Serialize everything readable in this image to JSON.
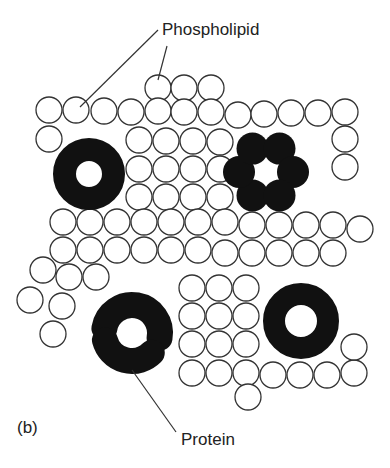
{
  "figure": {
    "panel_label": "(b)",
    "labels": {
      "phospholipid": "Phospholipid",
      "protein": "Protein"
    },
    "colors": {
      "stroke": "#333333",
      "protein_fill": "#111111",
      "background": "#ffffff"
    },
    "phospholipid_radius": 13,
    "phospholipids": [
      [
        158,
        88
      ],
      [
        184,
        88
      ],
      [
        211,
        88
      ],
      [
        49,
        110
      ],
      [
        76,
        110
      ],
      [
        104,
        111
      ],
      [
        131,
        112
      ],
      [
        158,
        111
      ],
      [
        184,
        112
      ],
      [
        211,
        112
      ],
      [
        238,
        115
      ],
      [
        264,
        114
      ],
      [
        291,
        113
      ],
      [
        318,
        113
      ],
      [
        345,
        112
      ],
      [
        49,
        139
      ],
      [
        139,
        140
      ],
      [
        166,
        141
      ],
      [
        193,
        141
      ],
      [
        220,
        142
      ],
      [
        345,
        139
      ],
      [
        139,
        169
      ],
      [
        166,
        169
      ],
      [
        193,
        169
      ],
      [
        220,
        169
      ],
      [
        345,
        167
      ],
      [
        139,
        197
      ],
      [
        166,
        197
      ],
      [
        193,
        197
      ],
      [
        220,
        197
      ],
      [
        63,
        222
      ],
      [
        90,
        222
      ],
      [
        117,
        222
      ],
      [
        144,
        222
      ],
      [
        171,
        222
      ],
      [
        198,
        222
      ],
      [
        225,
        222
      ],
      [
        252,
        225
      ],
      [
        279,
        225
      ],
      [
        306,
        225
      ],
      [
        333,
        225
      ],
      [
        360,
        229
      ],
      [
        63,
        250
      ],
      [
        90,
        250
      ],
      [
        117,
        250
      ],
      [
        144,
        250
      ],
      [
        171,
        250
      ],
      [
        198,
        250
      ],
      [
        225,
        253
      ],
      [
        252,
        253
      ],
      [
        279,
        253
      ],
      [
        306,
        253
      ],
      [
        333,
        253
      ],
      [
        43,
        270
      ],
      [
        69,
        277
      ],
      [
        96,
        277
      ],
      [
        30,
        300
      ],
      [
        62,
        306
      ],
      [
        53,
        334
      ],
      [
        192,
        288
      ],
      [
        219,
        288
      ],
      [
        246,
        288
      ],
      [
        192,
        316
      ],
      [
        219,
        316
      ],
      [
        246,
        316
      ],
      [
        192,
        344
      ],
      [
        219,
        344
      ],
      [
        246,
        344
      ],
      [
        192,
        373
      ],
      [
        219,
        373
      ],
      [
        246,
        373
      ],
      [
        273,
        375
      ],
      [
        300,
        375
      ],
      [
        327,
        375
      ],
      [
        354,
        373
      ],
      [
        354,
        347
      ],
      [
        248,
        397
      ]
    ],
    "proteins": [
      {
        "type": "ring",
        "cx": 89,
        "cy": 174,
        "r_outer": 36,
        "r_inner": 13
      },
      {
        "type": "ring",
        "cx": 301,
        "cy": 321,
        "r_outer": 38,
        "r_inner": 16
      },
      {
        "type": "hexamer",
        "cx": 266,
        "cy": 172,
        "ring_r": 27,
        "sub_r": 16
      },
      {
        "type": "split-ring",
        "cx": 132,
        "cy": 333,
        "r": 28,
        "thickness": 26
      }
    ]
  }
}
